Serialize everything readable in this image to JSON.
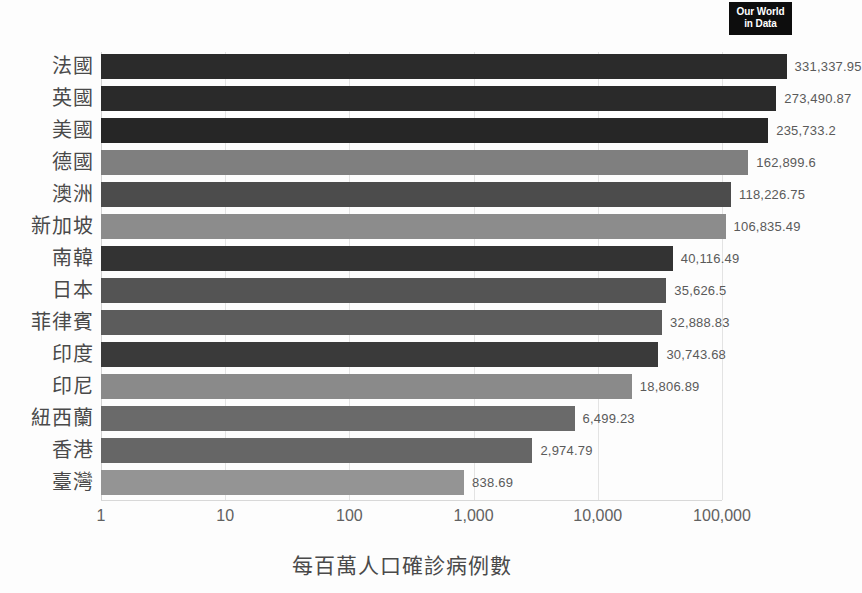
{
  "logo": {
    "line1": "Our World",
    "line2": "in Data",
    "name": "our-world-in-data-logo"
  },
  "chart_data": {
    "type": "bar",
    "orientation": "horizontal",
    "title": "",
    "xlabel": "每百萬人口確診病例數",
    "ylabel": "",
    "xscale": "log",
    "xlim": [
      1,
      1000000
    ],
    "grid": true,
    "legend": false,
    "xticks": [
      {
        "value": 1,
        "label": "1"
      },
      {
        "value": 10,
        "label": "10"
      },
      {
        "value": 100,
        "label": "100"
      },
      {
        "value": 1000,
        "label": "1,000"
      },
      {
        "value": 10000,
        "label": "10,000"
      },
      {
        "value": 100000,
        "label": "100,000"
      }
    ],
    "categories": [
      "法國",
      "英國",
      "美國",
      "德國",
      "澳洲",
      "新加坡",
      "南韓",
      "日本",
      "菲律賓",
      "印度",
      "印尼",
      "紐西蘭",
      "香港",
      "臺灣"
    ],
    "values": [
      331337.95,
      273490.87,
      235733.2,
      162899.6,
      118226.75,
      106835.49,
      40116.49,
      35626.5,
      32888.83,
      30743.68,
      18806.89,
      6499.23,
      2974.79,
      838.69
    ],
    "value_labels": [
      "331,337.95",
      "273,490.87",
      "235,733.2",
      "162,899.6",
      "118,226.75",
      "106,835.49",
      "40,116.49",
      "35,626.5",
      "32,888.83",
      "30,743.68",
      "18,806.89",
      "6,499.23",
      "2,974.79",
      "838.69"
    ],
    "bar_colors": [
      "#2b2b2b",
      "#2a2a2a",
      "#262626",
      "#7f7f7f",
      "#4c4c4c",
      "#8c8c8c",
      "#333333",
      "#545454",
      "#5c5c5c",
      "#3a3a3a",
      "#8a8a8a",
      "#6a6a6a",
      "#666666",
      "#949494"
    ],
    "bars": [
      {
        "category": "法國",
        "value": 331337.95,
        "label": "331,337.95",
        "color": "#2b2b2b"
      },
      {
        "category": "英國",
        "value": 273490.87,
        "label": "273,490.87",
        "color": "#2a2a2a"
      },
      {
        "category": "美國",
        "value": 235733.2,
        "label": "235,733.2",
        "color": "#262626"
      },
      {
        "category": "德國",
        "value": 162899.6,
        "label": "162,899.6",
        "color": "#7f7f7f"
      },
      {
        "category": "澳洲",
        "value": 118226.75,
        "label": "118,226.75",
        "color": "#4c4c4c"
      },
      {
        "category": "新加坡",
        "value": 106835.49,
        "label": "106,835.49",
        "color": "#8c8c8c"
      },
      {
        "category": "南韓",
        "value": 40116.49,
        "label": "40,116.49",
        "color": "#333333"
      },
      {
        "category": "日本",
        "value": 35626.5,
        "label": "35,626.5",
        "color": "#545454"
      },
      {
        "category": "菲律賓",
        "value": 32888.83,
        "label": "32,888.83",
        "color": "#5c5c5c"
      },
      {
        "category": "印度",
        "value": 30743.68,
        "label": "30,743.68",
        "color": "#3a3a3a"
      },
      {
        "category": "印尼",
        "value": 18806.89,
        "label": "18,806.89",
        "color": "#8a8a8a"
      },
      {
        "category": "紐西蘭",
        "value": 6499.23,
        "label": "6,499.23",
        "color": "#6a6a6a"
      },
      {
        "category": "香港",
        "value": 2974.79,
        "label": "2,974.79",
        "color": "#666666"
      },
      {
        "category": "臺灣",
        "value": 838.69,
        "label": "838.69",
        "color": "#949494"
      }
    ]
  }
}
